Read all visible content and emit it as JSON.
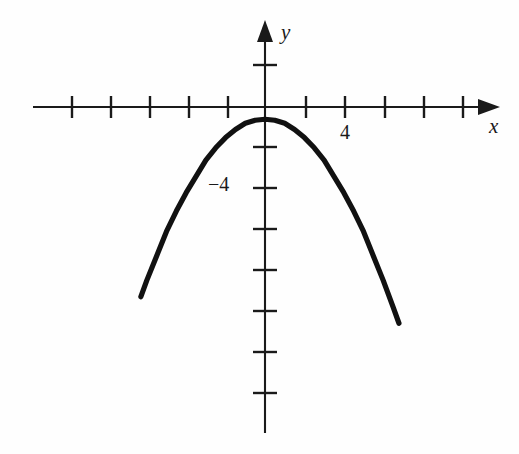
{
  "figure": {
    "kind": "cartesian-plot",
    "background_color": "#fefefe",
    "ink_color": "#111111"
  },
  "labels": {
    "x_axis": "x",
    "y_axis": "y",
    "x_tick_label": "4",
    "y_tick_label": "−4"
  },
  "chart_data": {
    "type": "line",
    "title": "",
    "subtitle": "",
    "xlabel": "x",
    "ylabel": "y",
    "grid": false,
    "legend": null,
    "xlim": [
      -11.5,
      11.5
    ],
    "ylim": [
      -16.0,
      4.2
    ],
    "x_tick_step": 2,
    "y_tick_step": 2,
    "x_ticks": [
      -10,
      -8,
      -6,
      -4,
      -2,
      2,
      4,
      6,
      8,
      10
    ],
    "y_ticks": [
      2,
      -2,
      -4,
      -6,
      -8,
      -10,
      -12,
      -14
    ],
    "x_tick_labels_shown": [
      {
        "value": 4,
        "text": "4"
      }
    ],
    "y_tick_labels_shown": [
      {
        "value": -4,
        "text": "−4"
      }
    ],
    "annotations": [],
    "series": [
      {
        "name": "parabola",
        "shape": "downward-opening parabola",
        "vertex": [
          0,
          -0.6
        ],
        "equation_approx": "y = -0.22x^2 - 0.6",
        "x": [
          -6.3,
          -6.0,
          -5.5,
          -5.0,
          -4.5,
          -4.0,
          -3.5,
          -3.0,
          -2.5,
          -2.0,
          -1.5,
          -1.0,
          -0.5,
          0.0,
          0.5,
          1.0,
          1.5,
          2.0,
          2.5,
          3.0,
          3.5,
          4.0,
          4.5,
          5.0,
          5.5,
          6.0,
          6.5,
          6.8
        ],
        "y": [
          -9.3,
          -8.5,
          -7.3,
          -6.1,
          -5.1,
          -4.2,
          -3.4,
          -2.6,
          -2.0,
          -1.5,
          -1.1,
          -0.8,
          -0.65,
          -0.6,
          -0.65,
          -0.8,
          -1.1,
          -1.5,
          -2.0,
          -2.6,
          -3.4,
          -4.2,
          -5.1,
          -6.1,
          -7.3,
          -8.5,
          -9.8,
          -10.6
        ]
      }
    ]
  },
  "geometry": {
    "origin_px": [
      265,
      107
    ],
    "unit_px_x": 19.7,
    "unit_px_y": 20.4,
    "x_axis_span_px": [
      33,
      498
    ],
    "y_axis_span_px": [
      22,
      433
    ],
    "tick_half_len_x_px": 11,
    "tick_half_len_y_px": 12
  }
}
